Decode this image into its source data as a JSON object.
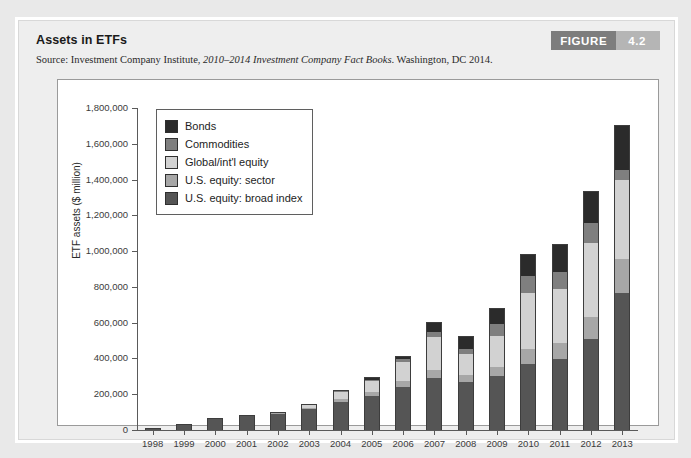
{
  "figure": {
    "badge_word": "FIGURE",
    "badge_number": "4.2",
    "title": "Assets in ETFs",
    "source_prefix": "Source: Investment Company Institute,",
    "source_italic": "2010–2014 Investment Company Fact Books",
    "source_suffix": ". Washington, DC 2014."
  },
  "colors": {
    "bonds": "#2b2b2b",
    "commodities": "#7f7f7f",
    "global_intl_equity": "#d2d2d2",
    "us_equity_sector": "#a7a7a7",
    "us_equity_broad_index": "#555555",
    "page_background": "#e9e9e9",
    "card_background": "#eeeeee",
    "plot_background": "#ffffff",
    "axis": "#5a5a5a",
    "badge_word_bg": "#7d7d7d",
    "badge_num_bg": "#b5b5b5"
  },
  "legend": {
    "items": [
      {
        "label": "Bonds",
        "key": "bonds"
      },
      {
        "label": "Commodities",
        "key": "commodities"
      },
      {
        "label": "Global/int'l equity",
        "key": "global_intl_equity"
      },
      {
        "label": "U.S. equity: sector",
        "key": "us_equity_sector"
      },
      {
        "label": "U.S. equity: broad index",
        "key": "us_equity_broad_index"
      }
    ]
  },
  "chart_data": {
    "type": "bar",
    "subtype": "stacked",
    "title": "Assets in ETFs",
    "xlabel": "",
    "ylabel": "ETF assets ($ million)",
    "ylim": [
      0,
      1800000
    ],
    "ytick_step": 200000,
    "ytick_labels": [
      "0",
      "200,000",
      "400,000",
      "600,000",
      "800,000",
      "1,000,000",
      "1,200,000",
      "1,400,000",
      "1,600,000",
      "1,800,000"
    ],
    "grid": false,
    "legend_position": "upper-left-inside",
    "categories": [
      "1998",
      "1999",
      "2000",
      "2001",
      "2002",
      "2003",
      "2004",
      "2005",
      "2006",
      "2007",
      "2008",
      "2009",
      "2010",
      "2011",
      "2012",
      "2013"
    ],
    "series": [
      {
        "name": "U.S. equity: broad index",
        "color": "#555555",
        "values": [
          14000,
          32000,
          62000,
          79000,
          90000,
          115000,
          155000,
          190000,
          240000,
          290000,
          270000,
          300000,
          370000,
          395000,
          510000,
          765000
        ]
      },
      {
        "name": "U.S. equity: sector",
        "color": "#a7a7a7",
        "values": [
          0,
          0,
          3000,
          3000,
          4000,
          8000,
          16000,
          22000,
          32000,
          48000,
          38000,
          52000,
          85000,
          92000,
          120000,
          190000
        ]
      },
      {
        "name": "Global/int'l equity",
        "color": "#d2d2d2",
        "values": [
          0,
          0,
          0,
          0,
          5000,
          18000,
          40000,
          65000,
          110000,
          180000,
          115000,
          175000,
          310000,
          300000,
          415000,
          440000
        ]
      },
      {
        "name": "Commodities",
        "color": "#7f7f7f",
        "values": [
          0,
          0,
          0,
          0,
          0,
          0,
          5000,
          5000,
          14000,
          30000,
          30000,
          66000,
          95000,
          95000,
          110000,
          60000
        ]
      },
      {
        "name": "Bonds",
        "color": "#2b2b2b",
        "values": [
          0,
          0,
          0,
          0,
          0,
          7000,
          8000,
          15000,
          20000,
          55000,
          70000,
          90000,
          125000,
          160000,
          180000,
          250000
        ]
      }
    ],
    "totals": [
      14000,
      32000,
      65000,
      82000,
      99000,
      148000,
      224000,
      297000,
      416000,
      603000,
      523000,
      683000,
      985000,
      1042000,
      1335000,
      1705000
    ]
  }
}
